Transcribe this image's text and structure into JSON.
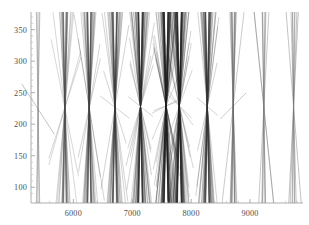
{
  "chart_data": {
    "type": "line",
    "title": "",
    "subtitle": "",
    "xlabel": "",
    "ylabel": "",
    "xlim": [
      5280,
      9900
    ],
    "ylim": [
      75,
      378
    ],
    "grid": false,
    "legend": null,
    "x_ticks_major": [
      6000,
      7000,
      8000,
      9000
    ],
    "x_tick_labels": [
      "6000",
      "7000",
      "8000",
      "9000"
    ],
    "x_ticks_minor": [
      5400,
      5600,
      5800,
      6200,
      6400,
      6600,
      6800,
      7200,
      7400,
      7600,
      7800,
      8200,
      8400,
      8600,
      8800,
      9200,
      9400,
      9600,
      9800
    ],
    "y_ticks_major": [
      100,
      150,
      200,
      250,
      300,
      350
    ],
    "y_tick_labels": [
      "100",
      "150",
      "200",
      "250",
      "300",
      "350"
    ],
    "y_ticks_minor": [
      90,
      110,
      120,
      130,
      140,
      160,
      170,
      180,
      190,
      210,
      220,
      230,
      240,
      260,
      270,
      280,
      290,
      310,
      320,
      330,
      340,
      360,
      370
    ],
    "series": [
      {
        "name": "pencil-1",
        "center_x": 5400,
        "center_y": 224,
        "n_lines": 5,
        "slope_spread": 9.5,
        "half_extent_x": 300,
        "color": "#7d7d7d",
        "opacity": 0.85,
        "stroke_width": 0.55
      },
      {
        "name": "pencil-2",
        "center_x": 5855,
        "center_y": 226,
        "n_lines": 34,
        "slope_spread": 7.0,
        "half_extent_x": 230,
        "color": "#4a4a4a",
        "opacity": 0.45,
        "stroke_width": 0.5
      },
      {
        "name": "pencil-3",
        "center_x": 6270,
        "center_y": 226,
        "n_lines": 40,
        "slope_spread": 6.2,
        "half_extent_x": 215,
        "color": "#3d3d3d",
        "opacity": 0.45,
        "stroke_width": 0.5
      },
      {
        "name": "pencil-4",
        "center_x": 6705,
        "center_y": 227,
        "n_lines": 44,
        "slope_spread": 6.0,
        "half_extent_x": 210,
        "color": "#3a3a3a",
        "opacity": 0.45,
        "stroke_width": 0.5
      },
      {
        "name": "pencil-5",
        "center_x": 7140,
        "center_y": 228,
        "n_lines": 70,
        "slope_spread": 5.4,
        "half_extent_x": 205,
        "color": "#2b2b2b",
        "opacity": 0.42,
        "stroke_width": 0.5
      },
      {
        "name": "pencil-6",
        "center_x": 7575,
        "center_y": 229,
        "n_lines": 95,
        "slope_spread": 5.0,
        "half_extent_x": 200,
        "color": "#212121",
        "opacity": 0.38,
        "stroke_width": 0.5
      },
      {
        "name": "pencil-7",
        "center_x": 7800,
        "center_y": 229,
        "n_lines": 88,
        "slope_spread": 5.0,
        "half_extent_x": 200,
        "color": "#212121",
        "opacity": 0.38,
        "stroke_width": 0.5
      },
      {
        "name": "pencil-8",
        "center_x": 8275,
        "center_y": 228,
        "n_lines": 52,
        "slope_spread": 5.8,
        "half_extent_x": 205,
        "color": "#343434",
        "opacity": 0.44,
        "stroke_width": 0.5
      },
      {
        "name": "pencil-9",
        "center_x": 8715,
        "center_y": 229,
        "n_lines": 16,
        "slope_spread": 9.0,
        "half_extent_x": 250,
        "color": "#6a6a6a",
        "opacity": 0.7,
        "stroke_width": 0.5
      },
      {
        "name": "pencil-10",
        "center_x": 9235,
        "center_y": 227,
        "n_lines": 9,
        "slope_spread": 8.5,
        "half_extent_x": 265,
        "color": "#767676",
        "opacity": 0.8,
        "stroke_width": 0.5
      },
      {
        "name": "pencil-11",
        "center_x": 9740,
        "center_y": 228,
        "n_lines": 8,
        "slope_spread": 9.0,
        "half_extent_x": 280,
        "color": "#767676",
        "opacity": 0.8,
        "stroke_width": 0.55
      }
    ]
  },
  "figure": {
    "background": "#ffffff",
    "axis_color": "#9a9a9a",
    "tick_label_color": "#4f4f4f",
    "plot_left_px": 31,
    "plot_right_px": 303,
    "plot_top_px": 12,
    "plot_bottom_px": 203
  }
}
